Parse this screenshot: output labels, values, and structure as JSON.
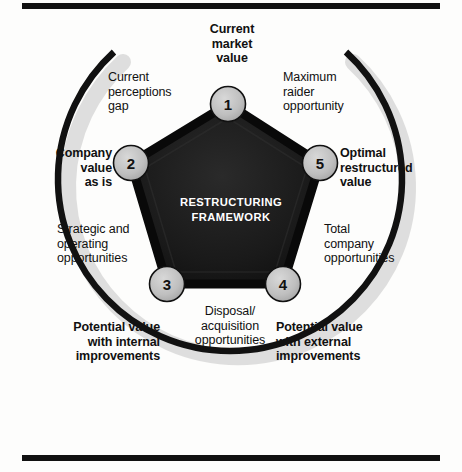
{
  "figure": {
    "center_title_line1": "RESTRUCTURING",
    "center_title_line2": "FRAMEWORK",
    "colors": {
      "pentagon_fill": "#161616",
      "pentagon_stroke": "#0a0a0a",
      "node_fill": "#bdbdbd",
      "node_stroke": "#111111",
      "arc_stroke": "#111111",
      "rule": "#111111",
      "text": "#111111",
      "center_text": "#ffffff"
    }
  },
  "rules": {
    "top": "horizontal-rule-top",
    "bottom": "horizontal-rule-bottom"
  },
  "nodes": [
    {
      "id": 1,
      "number": "1",
      "cx": 228,
      "cy": 104
    },
    {
      "id": 2,
      "number": "2",
      "cx": 131,
      "cy": 163
    },
    {
      "id": 3,
      "number": "3",
      "cx": 167,
      "cy": 284
    },
    {
      "id": 4,
      "number": "4",
      "cx": 283,
      "cy": 284
    },
    {
      "id": 5,
      "number": "5",
      "cx": 320,
      "cy": 163
    }
  ],
  "labels": {
    "current_market_value": "Current\nmarket\nvalue",
    "current_perceptions_gap": "Current\nperceptions\ngap",
    "maximum_raider_opportunity": "Maximum\nraider\nopportunity",
    "company_value_as_is": "Company\nvalue\nas is",
    "optimal_restructured_value": "Optimal\nrestructured\nvalue",
    "strategic_and_operating_opportunities": "Strategic and\noperating\nopportunities",
    "total_company_opportunities": "Total\ncompany\nopportunities",
    "disposal_acquisition_opportunities": "Disposal/\nacquisition\nopportunities",
    "potential_value_with_internal_improvements": "Potential value\nwith internal\nimprovements",
    "potential_value_with_external_improvements": "Potential value\nwith external\nimprovements"
  }
}
